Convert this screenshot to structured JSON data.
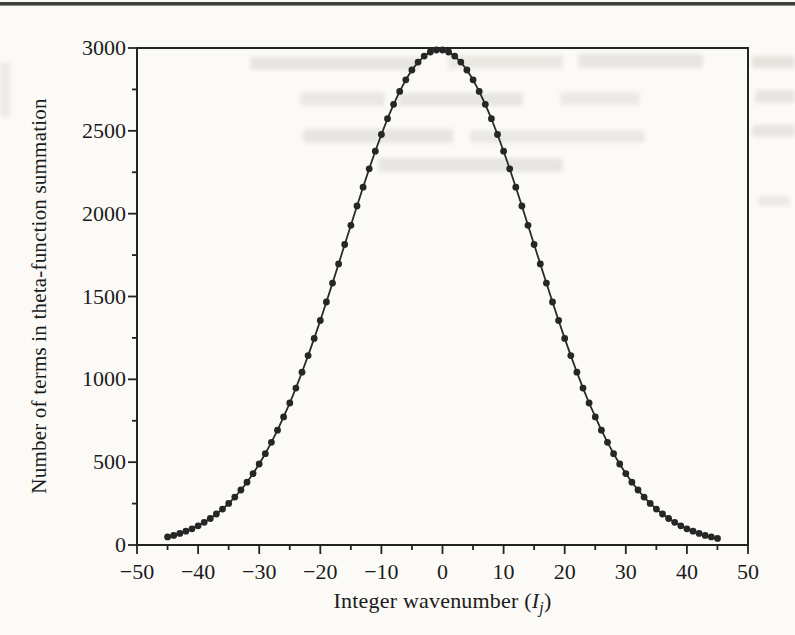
{
  "page": {
    "background": "#fbfaf7",
    "top_rule_color": "#3e3e3e"
  },
  "chart_data": {
    "type": "line",
    "title": "",
    "xlabel": "Integer wavenumber (Ij)",
    "xlabel_parts": {
      "prefix": "Integer wavenumber (",
      "variable": "I",
      "subscript": "j",
      "suffix": ")"
    },
    "ylabel": "Number of terms in theta-function summation",
    "xlim": [
      -50,
      50
    ],
    "ylim": [
      0,
      3000
    ],
    "grid": false,
    "legend": "none",
    "marker": "filled-circle",
    "x_major_ticks": [
      -50,
      -40,
      -30,
      -20,
      -10,
      0,
      10,
      20,
      30,
      40,
      50
    ],
    "x_tick_labels": [
      "−50",
      "−40",
      "−30",
      "−20",
      "−10",
      "0",
      "10",
      "20",
      "30",
      "40",
      "50"
    ],
    "x_minor_step": 5,
    "y_major_ticks": [
      0,
      500,
      1000,
      1500,
      2000,
      2500,
      3000
    ],
    "y_tick_labels": [
      "0",
      "500",
      "1000",
      "1500",
      "2000",
      "2500",
      "3000"
    ],
    "y_minor_step": 250,
    "colors": {
      "line": "#2a2a2a",
      "marker": "#262626",
      "axis": "#232323",
      "text": "#1b1b1b"
    },
    "series": [
      {
        "name": "theta-function summation terms",
        "x": [
          -45,
          -44,
          -43,
          -42,
          -41,
          -40,
          -39,
          -38,
          -37,
          -36,
          -35,
          -34,
          -33,
          -32,
          -31,
          -30,
          -29,
          -28,
          -27,
          -26,
          -25,
          -24,
          -23,
          -22,
          -21,
          -20,
          -19,
          -18,
          -17,
          -16,
          -15,
          -14,
          -13,
          -12,
          -11,
          -10,
          -9,
          -8,
          -7,
          -6,
          -5,
          -4,
          -3,
          -2,
          -1,
          0,
          1,
          2,
          3,
          4,
          5,
          6,
          7,
          8,
          9,
          10,
          11,
          12,
          13,
          14,
          15,
          16,
          17,
          18,
          19,
          20,
          21,
          22,
          23,
          24,
          25,
          26,
          27,
          28,
          29,
          30,
          31,
          32,
          33,
          34,
          35,
          36,
          37,
          38,
          39,
          40,
          41,
          42,
          43,
          44,
          45
        ],
        "y": [
          49,
          58,
          70,
          83,
          98,
          116,
          137,
          160,
          187,
          217,
          251,
          289,
          332,
          379,
          431,
          489,
          551,
          620,
          693,
          773,
          857,
          947,
          1043,
          1143,
          1247,
          1355,
          1467,
          1581,
          1697,
          1814,
          1930,
          2046,
          2160,
          2271,
          2377,
          2478,
          2573,
          2660,
          2738,
          2808,
          2867,
          2915,
          2951,
          2976,
          2988,
          2988,
          2976,
          2951,
          2915,
          2867,
          2808,
          2738,
          2660,
          2573,
          2478,
          2377,
          2271,
          2160,
          2046,
          1930,
          1814,
          1697,
          1581,
          1467,
          1355,
          1247,
          1143,
          1043,
          947,
          857,
          773,
          693,
          620,
          551,
          489,
          431,
          379,
          332,
          289,
          251,
          217,
          187,
          160,
          137,
          116,
          98,
          83,
          70,
          58,
          49,
          40
        ]
      }
    ]
  }
}
